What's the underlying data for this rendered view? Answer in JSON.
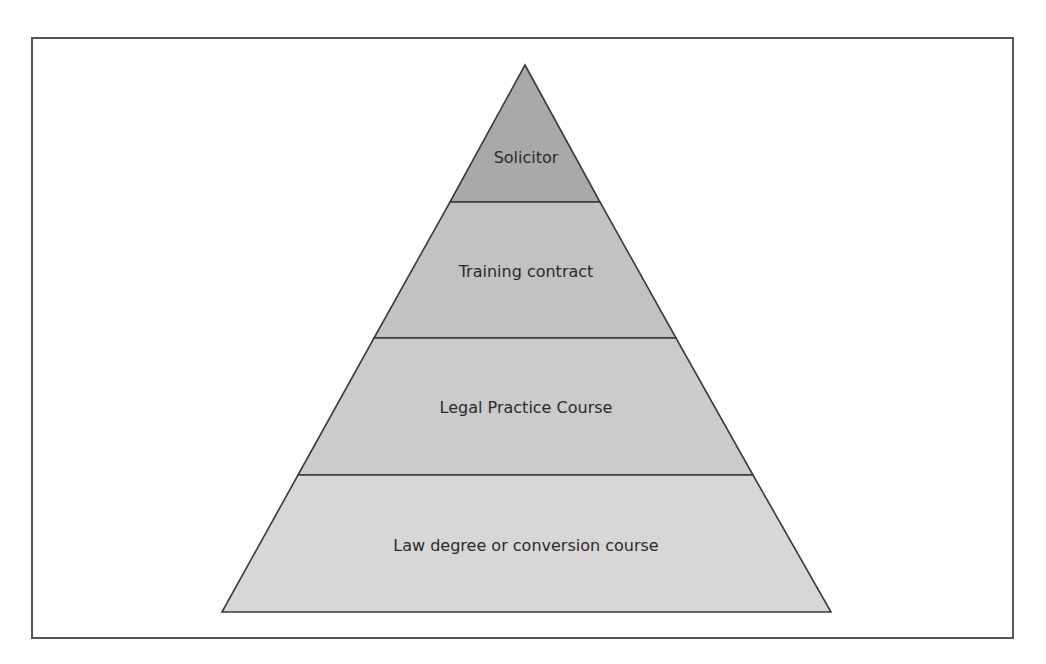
{
  "diagram": {
    "type": "pyramid",
    "levels": [
      {
        "label": "Solicitor",
        "fill": "#a9a9a9"
      },
      {
        "label": "Training contract",
        "fill": "#c2c2c2"
      },
      {
        "label": "Legal Practice Course",
        "fill": "#cbcbcb"
      },
      {
        "label": "Law degree or conversion course",
        "fill": "#d7d7d7"
      }
    ],
    "outline_color": "#3a3a3a",
    "frame_color": "#555555"
  }
}
